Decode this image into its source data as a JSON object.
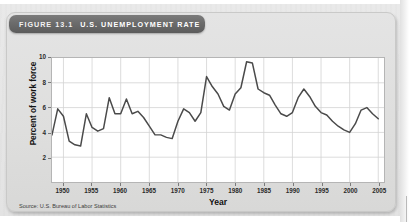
{
  "figure": {
    "number_label": "FIGURE 13.1",
    "title": "U.S. UNEMPLOYMENT RATE",
    "source": "Source: U.S. Bureau of Labor Statistics"
  },
  "chart_data": {
    "type": "line",
    "title": "U.S. UNEMPLOYMENT RATE",
    "xlabel": "Year",
    "ylabel": "Percent of work force",
    "xlim": [
      1948,
      2006
    ],
    "ylim": [
      0,
      10
    ],
    "grid": true,
    "legend": "none",
    "line_color": "#4a4a4a",
    "xticks": [
      1950,
      1955,
      1960,
      1965,
      1970,
      1975,
      1980,
      1985,
      1990,
      1995,
      2000,
      2005
    ],
    "yticks": [
      2,
      4,
      6,
      8,
      10
    ],
    "series": [
      {
        "name": "Unemployment rate",
        "x": [
          1948,
          1949,
          1950,
          1951,
          1952,
          1953,
          1954,
          1955,
          1956,
          1957,
          1958,
          1959,
          1960,
          1961,
          1962,
          1963,
          1964,
          1965,
          1966,
          1967,
          1968,
          1969,
          1970,
          1971,
          1972,
          1973,
          1974,
          1975,
          1976,
          1977,
          1978,
          1979,
          1980,
          1981,
          1982,
          1983,
          1984,
          1985,
          1986,
          1987,
          1988,
          1989,
          1990,
          1991,
          1992,
          1993,
          1994,
          1995,
          1996,
          1997,
          1998,
          1999,
          2000,
          2001,
          2002,
          2003,
          2004,
          2005
        ],
        "values": [
          3.8,
          5.9,
          5.3,
          3.3,
          3.0,
          2.9,
          5.5,
          4.4,
          4.1,
          4.3,
          6.8,
          5.5,
          5.5,
          6.7,
          5.5,
          5.7,
          5.2,
          4.5,
          3.8,
          3.8,
          3.6,
          3.5,
          4.9,
          5.9,
          5.6,
          4.9,
          5.6,
          8.5,
          7.7,
          7.1,
          6.1,
          5.8,
          7.1,
          7.6,
          9.7,
          9.6,
          7.5,
          7.2,
          7.0,
          6.2,
          5.5,
          5.3,
          5.6,
          6.8,
          7.5,
          6.9,
          6.1,
          5.6,
          5.4,
          4.9,
          4.5,
          4.2,
          4.0,
          4.7,
          5.8,
          6.0,
          5.5,
          5.1
        ]
      }
    ]
  },
  "axis": {
    "yticks": [
      "10",
      "8",
      "6",
      "4",
      "2"
    ],
    "xticks": [
      "1950",
      "1955",
      "1960",
      "1965",
      "1970",
      "1975",
      "1980",
      "1985",
      "1990",
      "1995",
      "2000",
      "2005"
    ]
  }
}
